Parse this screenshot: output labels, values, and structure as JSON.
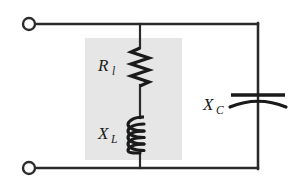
{
  "figure": {
    "name": "ac-parallel-rlc-circuit",
    "background_color": "#ffffff",
    "wire_color": "#2b2b2b",
    "highlight_box_color": "#e6e6e6",
    "label_color": "#1a1a1a",
    "width": 293,
    "height": 190
  },
  "terminals": [
    {
      "name": "top-left-terminal",
      "cx": 29,
      "cy": 24,
      "r": 6
    },
    {
      "name": "bottom-left-terminal",
      "cx": 29,
      "cy": 168,
      "r": 6
    }
  ],
  "highlight_box": {
    "label": "branch-highlight",
    "x": 85,
    "y": 38,
    "width": 97,
    "height": 122,
    "fill": "#e6e6e6"
  },
  "components": {
    "resistor": {
      "icon": "resistor-zigzag-icon",
      "label_main": "R",
      "label_sub": "l",
      "label_full": "Rl",
      "label_x": 98,
      "label_y": 71,
      "center_x": 140,
      "top_y": 48,
      "bottom_y": 86
    },
    "inductor": {
      "icon": "inductor-coil-icon",
      "label_main": "X",
      "label_sub": "L",
      "label_full": "XL",
      "label_x": 98,
      "label_y": 139,
      "center_x": 140,
      "top_y": 117,
      "bottom_y": 153,
      "turns": 5
    },
    "capacitor": {
      "icon": "capacitor-curved-plate-icon",
      "label_main": "X",
      "label_sub": "C",
      "label_full": "XC",
      "label_x": 203,
      "label_y": 110,
      "center_x": 258,
      "plate_y": 95,
      "plate_half_width": 27
    }
  },
  "wires": {
    "top_rail": {
      "name": "top-rail-wire",
      "x1": 35,
      "y1": 24,
      "x2": 258,
      "y2": 24
    },
    "bottom_rail": {
      "name": "bottom-rail-wire",
      "x1": 35,
      "y1": 168,
      "x2": 258,
      "y2": 168
    },
    "right_rail": {
      "name": "right-rail-wire",
      "x1": 258,
      "y1": 24,
      "x2": 258,
      "y2": 168
    },
    "branch_top": {
      "name": "branch-top-wire",
      "x1": 140,
      "y1": 24,
      "x2": 140,
      "y2": 48
    },
    "branch_mid": {
      "name": "branch-mid-wire",
      "x1": 140,
      "y1": 86,
      "x2": 140,
      "y2": 117
    },
    "branch_bottom": {
      "name": "branch-bottom-wire",
      "x1": 140,
      "y1": 153,
      "x2": 140,
      "y2": 168
    }
  }
}
